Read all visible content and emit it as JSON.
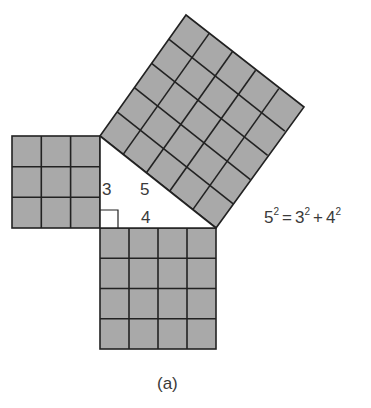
{
  "diagram": {
    "colors": {
      "square_fill": "#a9a9a9",
      "grid_line": "#222222",
      "text": "#3a3a3a",
      "background": "#ffffff"
    },
    "triangle": {
      "side_labels": {
        "vertical_leg": "3",
        "hypotenuse": "5",
        "horizontal_leg": "4"
      },
      "right_angle_marker": true
    },
    "squares": [
      {
        "name": "leg-3-square",
        "side": 3,
        "grid": "3x3"
      },
      {
        "name": "leg-4-square",
        "side": 4,
        "grid": "4x4"
      },
      {
        "name": "hypotenuse-5-square",
        "side": 5,
        "grid": "5x5"
      }
    ],
    "equation": {
      "lhs_base": "5",
      "lhs_exp": "2",
      "equals": "=",
      "term1_base": "3",
      "term1_exp": "2",
      "plus": "+",
      "term2_base": "4",
      "term2_exp": "2"
    },
    "caption": "(a)"
  }
}
